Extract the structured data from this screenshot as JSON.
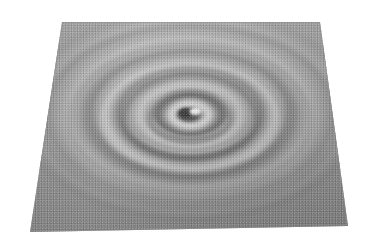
{
  "figure": {
    "type": "grayscale-3d-surface-plot",
    "title": "",
    "background_color": "#ffffff",
    "width": 367,
    "height": 250
  },
  "surface": {
    "name": "ripple-surface",
    "projection": "oblique-perspective",
    "corners": {
      "top_left": [
        62,
        22
      ],
      "top_right": [
        320,
        22
      ],
      "bottom_right": [
        348,
        226
      ],
      "bottom_left": [
        30,
        232
      ]
    },
    "base_color": "#9b9b9b",
    "highlight_color": "#d2d2d2",
    "shadow_color": "#636363",
    "edge_color": "#8e8e8e",
    "texture": "halftone-dither"
  },
  "chart_data": {
    "type": "heatmap",
    "title": "",
    "subtitle": "",
    "xlabel": "",
    "ylabel": "",
    "zlabel": "",
    "description": "Concentric circular standing-wave ripples radiating outward from a central point defect on a flat plane, viewed in oblique 3D perspective and rendered in grayscale with directional lighting.",
    "pattern": "damped radial cosine (Friedel-type standing wave)",
    "center_point": [
      190,
      115
    ],
    "ellipse_aspect_ratio": 0.62,
    "ring_count": 6,
    "ring_spacing_px": 26,
    "amplitude_decay": "1/r",
    "grid": false,
    "legend": null,
    "axes_visible": false,
    "tick_labels": [],
    "annotations": [],
    "rings": [
      {
        "index": 1,
        "radius_px": 14,
        "phase": "crest",
        "brightness": 0.86
      },
      {
        "index": 2,
        "radius_px": 38,
        "phase": "crest",
        "brightness": 0.74
      },
      {
        "index": 3,
        "radius_px": 64,
        "phase": "crest",
        "brightness": 0.66
      },
      {
        "index": 4,
        "radius_px": 90,
        "phase": "crest",
        "brightness": 0.6
      },
      {
        "index": 5,
        "radius_px": 116,
        "phase": "crest",
        "brightness": 0.56
      },
      {
        "index": 6,
        "radius_px": 142,
        "phase": "crest",
        "brightness": 0.53
      }
    ],
    "troughs": [
      {
        "index": 1,
        "radius_px": 26,
        "brightness": 0.3
      },
      {
        "index": 2,
        "radius_px": 51,
        "brightness": 0.36
      },
      {
        "index": 3,
        "radius_px": 77,
        "brightness": 0.41
      },
      {
        "index": 4,
        "radius_px": 103,
        "brightness": 0.45
      },
      {
        "index": 5,
        "radius_px": 129,
        "brightness": 0.47
      }
    ],
    "defect": {
      "name": "central-defect",
      "kind": "point-depression-with-highlight",
      "pit_color": "#4a4a4a",
      "highlight_color": "#f2f2f2",
      "pit_center": [
        186,
        114
      ],
      "pit_radius_px": 7,
      "highlight_center": [
        196,
        112
      ],
      "highlight_radius_px": 5
    },
    "lighting": {
      "direction": "top",
      "ridge_top_color": "#d0d0d0",
      "ridge_bottom_color": "#6e6e6e"
    },
    "value_range": [
      0.0,
      1.0
    ]
  }
}
